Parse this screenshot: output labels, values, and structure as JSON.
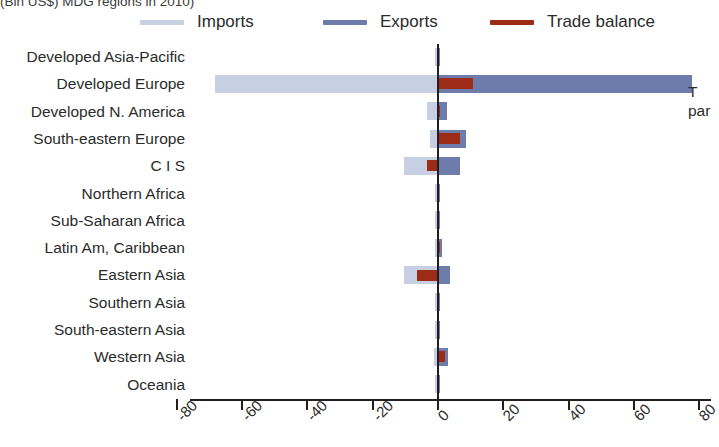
{
  "title_clipped": "(Bln US$) MDG regions in 2010)",
  "right_edge_clipped": {
    "line1": "T",
    "line2": "par"
  },
  "legend": {
    "position": "top",
    "items": [
      {
        "label": "Imports",
        "color": "#c7d0e2",
        "icon": "line-swatch-icon"
      },
      {
        "label": "Exports",
        "color": "#6d7caa",
        "icon": "line-swatch-icon"
      },
      {
        "label": "Trade balance",
        "color": "#9d2c17",
        "icon": "line-swatch-icon"
      }
    ]
  },
  "chart_data": {
    "type": "bar",
    "orientation": "horizontal",
    "title": "(Bln US$) MDG regions in 2010)",
    "xlabel": "",
    "ylabel": "",
    "xlim": [
      -90,
      85
    ],
    "grid": false,
    "legend_position": "top",
    "xticks": [
      -80,
      -60,
      -40,
      -20,
      0,
      20,
      40,
      60,
      80
    ],
    "xticklabels": [
      "-80",
      "-60",
      "-40",
      "-20",
      "0",
      "20",
      "40",
      "60",
      "80"
    ],
    "categories": [
      "Developed Asia-Pacific",
      "Developed Europe",
      "Developed N. America",
      "South-eastern Europe",
      "C I S",
      "Northern Africa",
      "Sub-Saharan Africa",
      "Latin Am, Caribbean",
      "Eastern Asia",
      "Southern Asia",
      "South-eastern Asia",
      "Western Asia",
      "Oceania"
    ],
    "series": [
      {
        "name": "Imports",
        "color": "#c7d0e2",
        "values": [
          -0.5,
          -68.0,
          -3.0,
          -2.0,
          -10.0,
          -0.3,
          -0.3,
          -0.5,
          -10.0,
          -0.3,
          -0.5,
          -0.8,
          -0.2
        ]
      },
      {
        "name": "Exports",
        "color": "#6d7caa",
        "values": [
          0.5,
          78.0,
          3.0,
          9.0,
          7.0,
          0.3,
          0.3,
          1.5,
          4.0,
          0.3,
          0.5,
          3.5,
          0.2
        ]
      },
      {
        "name": "Trade balance",
        "color": "#9d2c17",
        "values": [
          0.0,
          11.0,
          0.3,
          7.0,
          -3.0,
          0.0,
          0.0,
          1.0,
          -6.0,
          0.0,
          0.0,
          2.5,
          0.0
        ]
      }
    ]
  }
}
